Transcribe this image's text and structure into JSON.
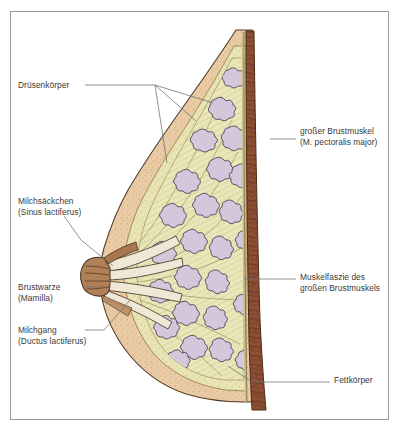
{
  "figure": {
    "type": "anatomical-cross-section",
    "frame_color": "#9a9a9a",
    "background_color": "#ffffff"
  },
  "palette": {
    "skin": "#e8c9a4",
    "skin_light": "#f0dcc0",
    "fat": "#e9e4b4",
    "fat_light": "#f2eeca",
    "gland": "#d6c6dc",
    "gland_outline": "#4a3a52",
    "muscle": "#8a4b30",
    "muscle_dark": "#6e3a22",
    "outline": "#4a3728",
    "leader_line": "#6e6e6e",
    "text": "#3a3a3a"
  },
  "labels": {
    "glandular_body": {
      "text": "Drüsenkörper",
      "side": "left",
      "x": 18,
      "y": 80
    },
    "milk_sinus": {
      "text": "Milchsäckchen\n(Sinus lactiferus)",
      "side": "left",
      "x": 18,
      "y": 196
    },
    "nipple": {
      "text": "Brustwarze\n(Mamilla)",
      "side": "left",
      "x": 18,
      "y": 282
    },
    "milk_duct": {
      "text": "Milchgang\n(Ductus lactiferus)",
      "side": "left",
      "x": 18,
      "y": 325
    },
    "pectoralis_major": {
      "text": "großer Brustmuskel\n(M. pectoralis major)",
      "side": "right",
      "x": 300,
      "y": 126
    },
    "muscle_fascia": {
      "text": "Muskelfaszie des\ngroßen Brustmuskels",
      "side": "right",
      "x": 300,
      "y": 272
    },
    "fat_body": {
      "text": "Fettkörper",
      "side": "right",
      "x": 334,
      "y": 375
    }
  },
  "leaders": {
    "glandular_body_trunk": "M 85 85 L 155 85",
    "glandular_body_fan_1": "M 155 85 L 167 163",
    "glandular_body_fan_2": "M 155 85 L 196 121",
    "glandular_body_fan_3": "M 155 85 L 213 103",
    "milk_sinus": "M 64 216 L 81 240 L 113 264",
    "nipple": "M 85 287 L 105 287",
    "milk_duct": "M 85 330 L 104 330 L 128 300",
    "pectoralis_major": "M 270 139 L 296 139",
    "muscle_fascia": "M 244 279 L 296 279",
    "fat_body_trunk": "M 252 382 L 330 382",
    "fat_body_fan": "M 252 382 L 230 367"
  }
}
